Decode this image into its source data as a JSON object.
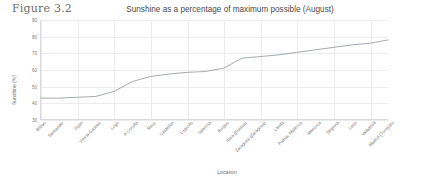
{
  "figure": {
    "caption": "Figure 3.2"
  },
  "axis": {
    "y_label": "Sunshine (%)",
    "x_label": "Location"
  },
  "chart_data": {
    "type": "line",
    "title": "Sunshine as a percentage of maximum possible (August)",
    "xlabel": "Location",
    "ylabel": "Sunshine (%)",
    "ylim": [
      30,
      90
    ],
    "yticks": [
      30,
      40,
      50,
      60,
      70,
      80,
      90
    ],
    "grid": true,
    "legend": "none",
    "line_color": "#9aa0a6",
    "categories": [
      "Bilbao",
      "Santander",
      "Gijón",
      "Vitoria-Gasteiz",
      "Lugo",
      "A Coruña",
      "Reus",
      "Castellón",
      "Logroño",
      "Valencia",
      "Burgos",
      "Ibiza (Eivissa)",
      "Zaragoza (Zaragoza)",
      "Lleida",
      "Palma, Mallorca",
      "Menorca",
      "Segovia",
      "León",
      "Valladolid",
      "Madrid (Torrejón)"
    ],
    "values": [
      43,
      43,
      43.5,
      44,
      47,
      53,
      56,
      57.5,
      58.5,
      59,
      61,
      67,
      68,
      69,
      70.5,
      72,
      73.5,
      75,
      76,
      78
    ]
  }
}
